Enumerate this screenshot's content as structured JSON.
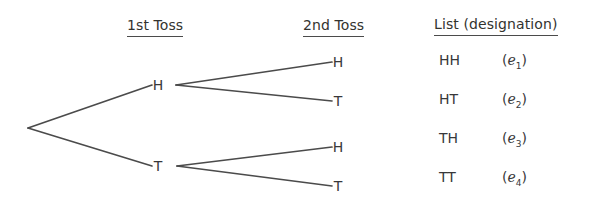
{
  "headers": {
    "first_toss": "1st Toss",
    "second_toss": "2nd Toss",
    "list": "List (designation)"
  },
  "tree": {
    "level1": [
      {
        "label": "H"
      },
      {
        "label": "T"
      }
    ],
    "leaves": [
      {
        "label": "H"
      },
      {
        "label": "T"
      },
      {
        "label": "H"
      },
      {
        "label": "T"
      }
    ]
  },
  "outcomes": [
    {
      "pair": "HH",
      "symbol": "e",
      "index": "1"
    },
    {
      "pair": "HT",
      "symbol": "e",
      "index": "2"
    },
    {
      "pair": "TH",
      "symbol": "e",
      "index": "3"
    },
    {
      "pair": "TT",
      "symbol": "e",
      "index": "4"
    }
  ],
  "colors": {
    "background": "#ffffff",
    "line": "#4b4b4b",
    "text": "#38383a"
  }
}
